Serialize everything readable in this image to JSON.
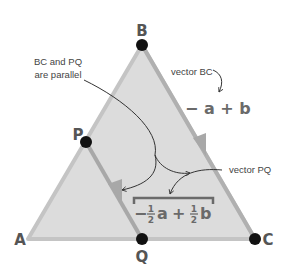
{
  "points": {
    "A": {
      "label": "A",
      "x": 28,
      "y": 239
    },
    "B": {
      "label": "B",
      "x": 142,
      "y": 45
    },
    "C": {
      "label": "C",
      "x": 255,
      "y": 239
    },
    "P": {
      "label": "P",
      "x": 86,
      "y": 142
    },
    "Q": {
      "label": "Q",
      "x": 142,
      "y": 239
    }
  },
  "annotations": {
    "parallel_line1": "BC and PQ",
    "parallel_line2": "are parallel",
    "vector_bc_label": "vector BC",
    "vector_bc_expr": "− a + b",
    "vector_pq_label": "vector PQ",
    "vector_pq_expr": {
      "minus": "−",
      "half_num1": "1",
      "half_den1": "2",
      "a": "a",
      "plus": "+",
      "half_num2": "1",
      "half_den2": "2",
      "b": "b"
    }
  },
  "colors": {
    "triangle_fill": "#dcdcdc",
    "triangle_edge": "#c4c4c4",
    "vector_edge": "#a8a8a8",
    "dot": "#111111",
    "text": "#555555"
  }
}
